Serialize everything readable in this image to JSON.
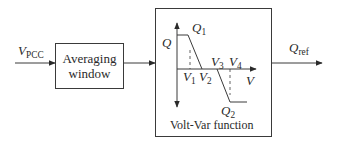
{
  "diagram": {
    "input": {
      "symbol": "V",
      "subscript": "PCC"
    },
    "averaging_block": {
      "line1": "Averaging",
      "line2": "window"
    },
    "voltvar_block": {
      "caption": "Volt-Var function",
      "axes": {
        "y_label": "Q",
        "x_label": "V"
      },
      "points": {
        "q1": {
          "symbol": "Q",
          "subscript": "1"
        },
        "q2": {
          "symbol": "Q",
          "subscript": "2"
        },
        "v1": {
          "symbol": "V",
          "subscript": "1"
        },
        "v2": {
          "symbol": "V",
          "subscript": "2"
        },
        "v3": {
          "symbol": "V",
          "subscript": "3"
        },
        "v4": {
          "symbol": "V",
          "subscript": "4"
        }
      }
    },
    "output": {
      "symbol": "Q",
      "subscript": "ref"
    },
    "colors": {
      "line": "#3a3a3a",
      "background": "#ffffff"
    }
  }
}
